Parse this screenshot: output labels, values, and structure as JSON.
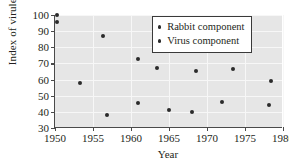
{
  "chart_data": {
    "type": "scatter",
    "title": "",
    "xlabel": "Year",
    "ylabel": "Index of virulence",
    "xlim": [
      1950,
      1980
    ],
    "ylim": [
      30,
      100
    ],
    "xticks": [
      1950,
      1955,
      1960,
      1965,
      1970,
      1975,
      1980
    ],
    "yticks": [
      30,
      40,
      50,
      60,
      70,
      80,
      90,
      100
    ],
    "grid": true,
    "legend_position": "top-right",
    "marker_color": "#2b2b2b",
    "plot_background": "#e6e6e6",
    "gridline_color": "#f7f7f7",
    "series": [
      {
        "name": "Rabbit component",
        "points": [
          {
            "x": 1950.2,
            "y": 100
          },
          {
            "x": 1950.2,
            "y": 96
          },
          {
            "x": 1956.3,
            "y": 86.8
          },
          {
            "x": 1960.9,
            "y": 72.8
          },
          {
            "x": 1963.4,
            "y": 67.5
          },
          {
            "x": 1968.6,
            "y": 65.5
          },
          {
            "x": 1973.4,
            "y": 66.4
          },
          {
            "x": 1978.4,
            "y": 59
          }
        ]
      },
      {
        "name": "Virus component",
        "points": [
          {
            "x": 1953.3,
            "y": 58.2
          },
          {
            "x": 1956.9,
            "y": 38.2
          },
          {
            "x": 1960.9,
            "y": 45.6
          },
          {
            "x": 1965.0,
            "y": 41.1
          },
          {
            "x": 1968.0,
            "y": 40.1
          },
          {
            "x": 1972.0,
            "y": 46.0
          },
          {
            "x": 1978.1,
            "y": 44.4
          }
        ]
      }
    ]
  }
}
